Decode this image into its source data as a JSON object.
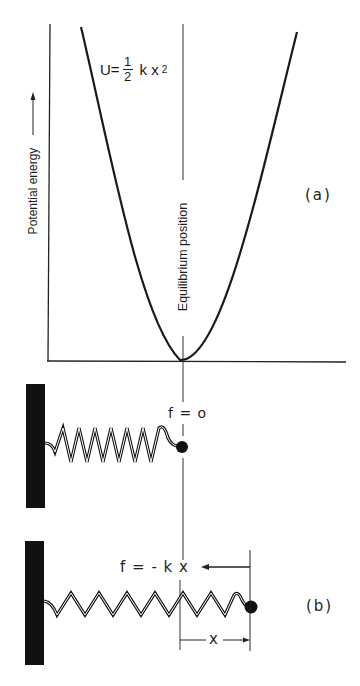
{
  "figure": {
    "panel_a": {
      "label": "(a)",
      "y_axis_label": "Potential energy",
      "equilibrium_label": "Equilibrium position",
      "formula": {
        "lhs": "U=",
        "numerator": "1",
        "denominator": "2",
        "rhs": "k x",
        "exponent": "2"
      }
    },
    "panel_b_rest": {
      "force_label": "f = o"
    },
    "panel_b": {
      "label": "(b)",
      "force_label": "f = - k x",
      "displacement_label": "x"
    }
  },
  "colors": {
    "ink": "#1a1a1a",
    "background": "#ffffff"
  }
}
